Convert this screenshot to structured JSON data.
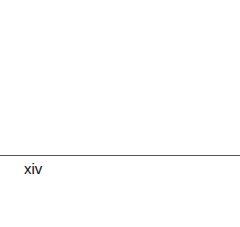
{
  "page": {
    "footer": {
      "page_number": "xiv"
    },
    "colors": {
      "background": "#ffffff",
      "rule": "#555555",
      "text": "#111111"
    }
  }
}
